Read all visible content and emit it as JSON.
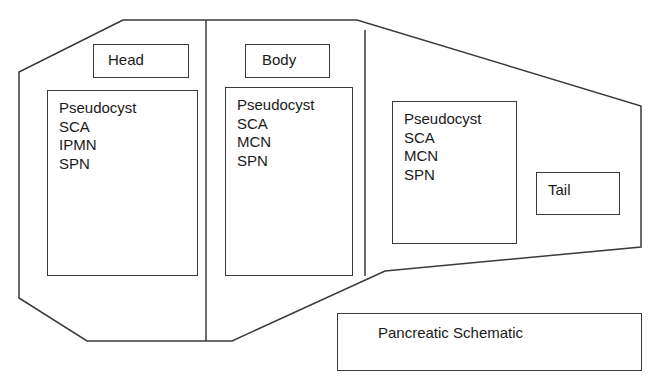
{
  "diagram": {
    "title": "Pancreatic Schematic",
    "regions": [
      {
        "id": "head",
        "label": "Head",
        "items": [
          "Pseudocyst",
          "SCA",
          "IPMN",
          "SPN"
        ]
      },
      {
        "id": "body",
        "label": "Body",
        "items": [
          "Pseudocyst",
          "SCA",
          "MCN",
          "SPN"
        ]
      },
      {
        "id": "tail",
        "label": "Tail",
        "items": [
          "Pseudocyst",
          "SCA",
          "MCN",
          "SPN"
        ]
      }
    ],
    "colors": {
      "stroke": "#3a3a3a",
      "text": "#1a1a1a",
      "background": "#ffffff"
    }
  }
}
